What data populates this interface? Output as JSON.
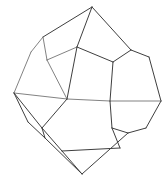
{
  "figure": {
    "shape_name": "dodecahedron",
    "background_color": "#ffffff",
    "line_color": "#4a4a4a",
    "back_line_color": "#6b6b6b",
    "line_width": 0.9,
    "canvas": {
      "width": 168,
      "height": 182
    },
    "vertices": {
      "top_apex": [
        92,
        7
      ],
      "bottom_apex": [
        82,
        174
      ],
      "left_equator": [
        14,
        93
      ],
      "right_equator": [
        161,
        101
      ],
      "upper_left_outer": [
        31,
        52
      ],
      "upper_right_outer": [
        149,
        57
      ],
      "upper_left_inner": [
        43,
        37
      ],
      "upper_mid_inner": [
        47,
        60
      ],
      "upper_right_inner": [
        131,
        50
      ],
      "center_left": [
        67,
        99
      ],
      "center_right": [
        110,
        101
      ],
      "center_top": [
        113,
        62
      ],
      "center_upper_left": [
        77,
        47
      ],
      "lower_left_outer": [
        28,
        122
      ],
      "lower_right_outer": [
        146,
        128
      ],
      "lower_left_inner": [
        42,
        128
      ],
      "lower_mid_left": [
        45,
        138
      ],
      "lower_right_inner": [
        112,
        128
      ],
      "lower_mid_right": [
        128,
        133
      ],
      "bottom_left_inner": [
        62,
        151
      ],
      "bottom_right_inner": [
        120,
        148
      ]
    },
    "edges": [
      {
        "name": "top-apex-to-upper-left-inner",
        "from": "top_apex",
        "to": "upper_left_inner",
        "depth": "front"
      },
      {
        "name": "top-apex-to-center-upper-left",
        "from": "top_apex",
        "to": "center_upper_left",
        "depth": "front"
      },
      {
        "name": "top-apex-to-upper-right-inner",
        "from": "top_apex",
        "to": "upper_right_inner",
        "depth": "front"
      },
      {
        "name": "upper-left-inner-to-upper-mid",
        "from": "upper_left_inner",
        "to": "upper_mid_inner",
        "depth": "back"
      },
      {
        "name": "upper-left-inner-to-outer",
        "from": "upper_left_inner",
        "to": "upper_left_outer",
        "depth": "back"
      },
      {
        "name": "upper-mid-to-center-upper-left",
        "from": "upper_mid_inner",
        "to": "center_upper_left",
        "depth": "back"
      },
      {
        "name": "upper-mid-to-center-left",
        "from": "upper_mid_inner",
        "to": "center_left",
        "depth": "back"
      },
      {
        "name": "center-upper-left-to-center-left",
        "from": "center_upper_left",
        "to": "center_left",
        "depth": "front"
      },
      {
        "name": "center-upper-left-to-center-top",
        "from": "center_upper_left",
        "to": "center_top",
        "depth": "front"
      },
      {
        "name": "center-top-to-upper-right-inner",
        "from": "center_top",
        "to": "upper_right_inner",
        "depth": "front"
      },
      {
        "name": "center-top-to-center-right",
        "from": "center_top",
        "to": "center_right",
        "depth": "front"
      },
      {
        "name": "upper-right-inner-to-outer",
        "from": "upper_right_inner",
        "to": "upper_right_outer",
        "depth": "front"
      },
      {
        "name": "upper-left-outer-to-left-eq",
        "from": "upper_left_outer",
        "to": "left_equator",
        "depth": "back"
      },
      {
        "name": "upper-right-outer-to-right-eq",
        "from": "upper_right_outer",
        "to": "right_equator",
        "depth": "front"
      },
      {
        "name": "left-eq-to-center-left",
        "from": "left_equator",
        "to": "center_left",
        "depth": "back"
      },
      {
        "name": "center-left-to-center-right",
        "from": "center_left",
        "to": "center_right",
        "depth": "back"
      },
      {
        "name": "center-right-to-right-eq",
        "from": "center_right",
        "to": "right_equator",
        "depth": "back"
      },
      {
        "name": "left-eq-to-lower-left-outer",
        "from": "left_equator",
        "to": "lower_left_outer",
        "depth": "front"
      },
      {
        "name": "left-eq-to-lower-left-inner",
        "from": "left_equator",
        "to": "lower_left_inner",
        "depth": "front"
      },
      {
        "name": "right-eq-to-lower-right-outer",
        "from": "right_equator",
        "to": "lower_right_outer",
        "depth": "front"
      },
      {
        "name": "center-left-to-lower-left-inner",
        "from": "center_left",
        "to": "lower_left_inner",
        "depth": "front"
      },
      {
        "name": "center-right-to-lower-right-inner",
        "from": "center_right",
        "to": "lower_right_inner",
        "depth": "front"
      },
      {
        "name": "lower-left-outer-to-mid-left",
        "from": "lower_left_outer",
        "to": "lower_mid_left",
        "depth": "front"
      },
      {
        "name": "lower-left-inner-to-mid-left",
        "from": "lower_left_inner",
        "to": "lower_mid_left",
        "depth": "front"
      },
      {
        "name": "lower-left-inner-to-bottom-left",
        "from": "lower_left_inner",
        "to": "bottom_left_inner",
        "depth": "front"
      },
      {
        "name": "lower-right-inner-to-mid-right",
        "from": "lower_right_inner",
        "to": "lower_mid_right",
        "depth": "front"
      },
      {
        "name": "lower-right-outer-to-mid-right",
        "from": "lower_right_outer",
        "to": "lower_mid_right",
        "depth": "front"
      },
      {
        "name": "lower-right-inner-to-bottom-right",
        "from": "lower_right_inner",
        "to": "bottom_right_inner",
        "depth": "front"
      },
      {
        "name": "bottom-left-to-bottom-right",
        "from": "bottom_left_inner",
        "to": "bottom_right_inner",
        "depth": "front"
      },
      {
        "name": "bottom-left-to-bottom-apex",
        "from": "bottom_left_inner",
        "to": "bottom_apex",
        "depth": "front"
      },
      {
        "name": "mid-left-to-bottom-apex",
        "from": "lower_mid_left",
        "to": "bottom_apex",
        "depth": "front"
      },
      {
        "name": "mid-right-to-bottom-apex",
        "from": "lower_mid_right",
        "to": "bottom_apex",
        "depth": "front"
      }
    ]
  }
}
